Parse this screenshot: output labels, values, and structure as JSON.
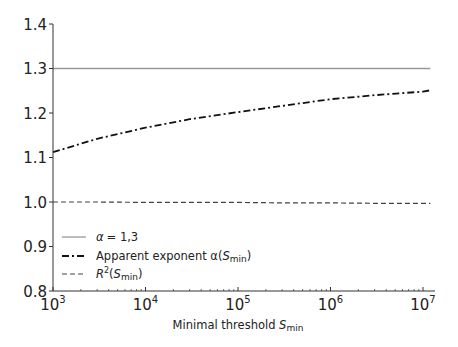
{
  "chart_data": {
    "type": "line",
    "title": "",
    "xlabel": "Minimal threshold S_min",
    "xlabel_main": "Minimal threshold ",
    "xlabel_var": "S",
    "xlabel_sub": "min",
    "ylabel": "",
    "xscale": "log",
    "xlim": [
      1000,
      12000000
    ],
    "ylim": [
      0.8,
      1.4
    ],
    "grid": false,
    "legend_position": "lower left",
    "x_ticks": [
      {
        "value": 1000,
        "base": "10",
        "exp": "3"
      },
      {
        "value": 10000,
        "base": "10",
        "exp": "4"
      },
      {
        "value": 100000,
        "base": "10",
        "exp": "5"
      },
      {
        "value": 1000000,
        "base": "10",
        "exp": "6"
      },
      {
        "value": 10000000,
        "base": "10",
        "exp": "7"
      }
    ],
    "y_ticks": [
      "0.8",
      "0.9",
      "1.0",
      "1.1",
      "1.2",
      "1.3",
      "1.4"
    ],
    "x": [
      1000,
      3000,
      10000,
      30000,
      100000,
      300000,
      1000000,
      3000000,
      10000000,
      12000000
    ],
    "series": [
      {
        "name": "α = 1,3",
        "style": "solid",
        "color": "#999999",
        "values": [
          1.3,
          1.3,
          1.3,
          1.3,
          1.3,
          1.3,
          1.3,
          1.3,
          1.3,
          1.3
        ]
      },
      {
        "name": "Apparent exponent α(S_min)",
        "style": "dashdot",
        "color": "#111111",
        "values": [
          1.112,
          1.142,
          1.167,
          1.186,
          1.202,
          1.216,
          1.231,
          1.24,
          1.248,
          1.251
        ]
      },
      {
        "name": "R²(S_min)",
        "style": "dashed",
        "color": "#444444",
        "values": [
          1.0,
          1.0,
          0.999,
          0.999,
          0.999,
          0.998,
          0.998,
          0.997,
          0.997,
          0.997
        ]
      }
    ]
  },
  "legend": {
    "items": [
      {
        "prefix": "α",
        "text": "= 1,3"
      },
      {
        "text": "Apparent exponent α(",
        "var": "S",
        "sub": "min",
        "suffix": ")"
      },
      {
        "var": "R",
        "sup": "2",
        "text": "(",
        "var2": "S",
        "sub": "min",
        "suffix": ")"
      }
    ]
  }
}
